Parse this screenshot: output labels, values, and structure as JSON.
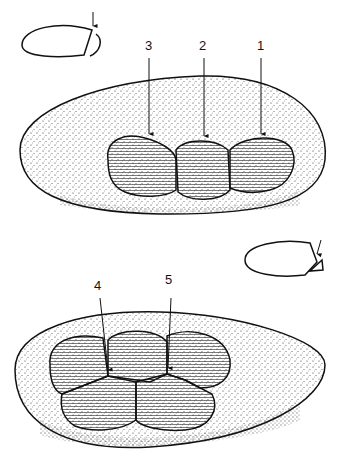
{
  "figure": {
    "panels": [
      {
        "id": "top",
        "labels": [
          {
            "text": "3",
            "x": 149,
            "y": 50
          },
          {
            "text": "2",
            "x": 203,
            "y": 50
          },
          {
            "text": "1",
            "x": 261,
            "y": 50
          }
        ]
      },
      {
        "id": "bottom",
        "labels": [
          {
            "text": "4",
            "x": 98,
            "y": 290
          },
          {
            "text": "5",
            "x": 169,
            "y": 284
          }
        ]
      }
    ],
    "colors": {
      "ink": "#111111",
      "background": "#ffffff",
      "stipple": "#333333"
    }
  }
}
